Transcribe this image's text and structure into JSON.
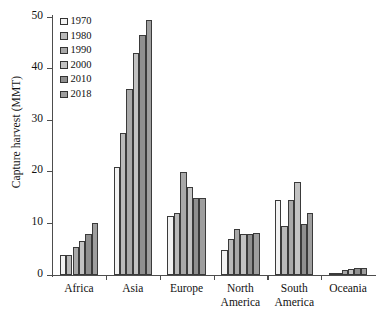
{
  "chart_data": {
    "type": "bar",
    "title": "",
    "xlabel": "",
    "ylabel": "Capture harvest (MMT)",
    "ylim": [
      0,
      50
    ],
    "yticks": [
      0,
      10,
      20,
      30,
      40,
      50
    ],
    "grid": false,
    "legend_position": "top-left",
    "categories": [
      "Africa",
      "Asia",
      "Europe",
      "North America",
      "South America",
      "Oceania"
    ],
    "series": [
      {
        "name": "1970",
        "color": "#f2f2f2",
        "values": [
          3.9,
          21.0,
          11.5,
          4.8,
          14.5,
          0.2
        ]
      },
      {
        "name": "1980",
        "color": "#b9b9b9",
        "values": [
          3.9,
          27.5,
          12.0,
          7.0,
          9.5,
          0.4
        ]
      },
      {
        "name": "1990",
        "color": "#a8a8a8",
        "values": [
          5.5,
          36.0,
          20.0,
          9.0,
          14.5,
          0.9
        ]
      },
      {
        "name": "2000",
        "color": "#c2c2c2",
        "values": [
          6.5,
          43.0,
          17.0,
          8.0,
          18.0,
          1.2
        ]
      },
      {
        "name": "2010",
        "color": "#8f8f8f",
        "values": [
          8.0,
          46.5,
          15.0,
          8.0,
          9.8,
          1.3
        ]
      },
      {
        "name": "2018",
        "color": "#9e9e9e",
        "values": [
          10.0,
          49.5,
          15.0,
          8.2,
          12.0,
          1.3
        ]
      }
    ]
  },
  "axes": {
    "y_title": "Capture harvest (MMT)",
    "y_tick_labels": [
      "0",
      "10",
      "20",
      "30",
      "40",
      "50"
    ],
    "x_tick_labels": [
      "Africa",
      "Asia",
      "Europe",
      "North America",
      "South America",
      "Oceania"
    ]
  },
  "legend": {
    "entries": [
      {
        "label": "1970"
      },
      {
        "label": "1980"
      },
      {
        "label": "1990"
      },
      {
        "label": "2000"
      },
      {
        "label": "2010"
      },
      {
        "label": "2018"
      }
    ]
  }
}
